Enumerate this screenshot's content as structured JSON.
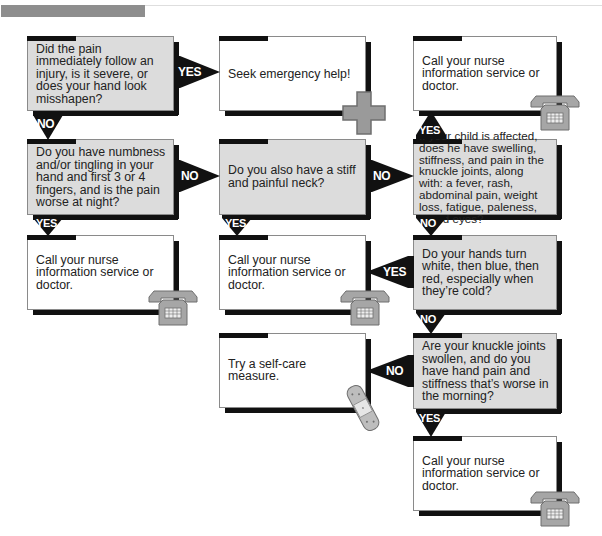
{
  "header": {
    "bar_color": "#8e8e8e"
  },
  "colors": {
    "question_fill": "#dcdcdc",
    "answer_fill": "#ffffff",
    "arrow": "#111111",
    "icon_gray": "#9a9a9a"
  },
  "nodes": {
    "q_injury": "Did the pain immediately follow an injury, is it severe, or does your hand look misshapen?",
    "a_emergency": "Seek emergency help!",
    "a_call_top": "Call your nurse information service or doctor.",
    "q_numbness": "Do you have numbness and/or tingling in your hand and first 3 or 4 fingers, and is the pain worse at night?",
    "q_neck": "Do you also have a stiff and painful neck?",
    "q_child": "If your child is affected, does he have swelling, stiffness, and pain in the knuckle joints, along with: a fever, rash, abdominal pain, weight loss, fatigue, paleness, or red eyes?",
    "a_call_left": "Call your nurse information service or doctor.",
    "a_call_mid": "Call your nurse information service or doctor.",
    "q_raynaud": "Do your hands turn white, then blue, then red, especially when they’re cold?",
    "a_selfcare": "Try a self-care measure.",
    "q_knuckle": "Are your knuckle joints swollen, and do you have hand pain and stiffness that’s worse in the morning?",
    "a_call_bottom": "Call your nurse information service or doctor."
  },
  "edges": {
    "injury_yes": "YES",
    "injury_no": "NO",
    "numbness_no": "NO",
    "numbness_yes": "YES",
    "neck_no": "NO",
    "neck_yes": "YES",
    "child_yes": "YES",
    "child_no": "NO",
    "raynaud_yes": "YES",
    "raynaud_no": "NO",
    "knuckle_no": "NO",
    "knuckle_yes": "YES"
  },
  "icons": {
    "emergency": "medical-cross-icon",
    "phone": "telephone-icon",
    "bandage": "bandage-icon"
  }
}
